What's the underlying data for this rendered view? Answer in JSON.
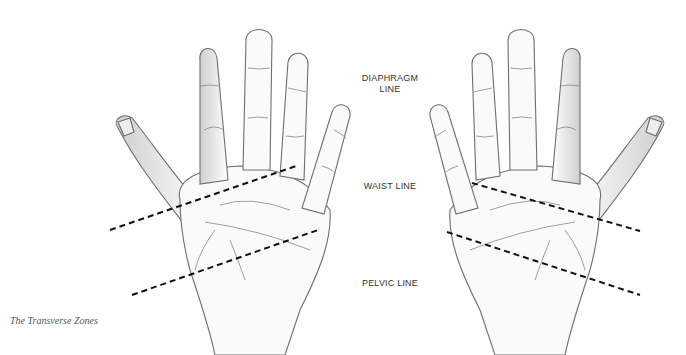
{
  "labels": {
    "diaphragm_line_1": "DIAPHRAGM",
    "diaphragm_line_2": "LINE",
    "waist_line": "WAIST LINE",
    "pelvic_line": "PELVIC LINE"
  },
  "caption": "The Transverse Zones",
  "colors": {
    "outline": "#6e6e6e",
    "shade": "#d9d9d9",
    "dash": "#111111",
    "label": "#333333"
  },
  "zones": {
    "left_hand": {
      "waist": {
        "x1": 110,
        "y1": 230,
        "x2": 296,
        "y2": 166
      },
      "pelvic": {
        "x1": 132,
        "y1": 295,
        "x2": 318,
        "y2": 230
      }
    },
    "right_hand": {
      "waist": {
        "x1": 472,
        "y1": 183,
        "x2": 640,
        "y2": 231
      },
      "pelvic": {
        "x1": 447,
        "y1": 232,
        "x2": 640,
        "y2": 295
      }
    }
  }
}
